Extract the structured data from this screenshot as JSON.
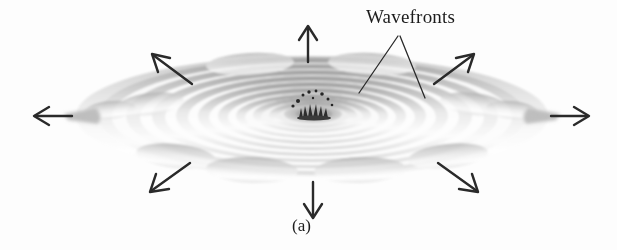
{
  "figure": {
    "panel_label": "(a)",
    "annotation_label": "Wavefronts",
    "background_color": "#fdfdfd",
    "ink_color": "#2a2a2a",
    "wave_light": "#ffffff",
    "wave_mid": "#c9c9c9",
    "wave_dark": "#9a9a9a"
  },
  "geometry": {
    "center_x": 312,
    "center_y": 116,
    "ring_count": 11,
    "outer_rx": 236,
    "outer_ry": 62
  },
  "arrows": [
    {
      "name": "arrow-up",
      "direction": "up",
      "angle_deg": 270,
      "tip_x": 308,
      "tip_y": 26
    },
    {
      "name": "arrow-down",
      "direction": "down",
      "angle_deg": 90,
      "tip_x": 313,
      "tip_y": 218
    },
    {
      "name": "arrow-left",
      "direction": "left",
      "angle_deg": 180,
      "tip_x": 34,
      "tip_y": 116
    },
    {
      "name": "arrow-right",
      "direction": "right",
      "angle_deg": 0,
      "tip_x": 588,
      "tip_y": 116
    },
    {
      "name": "arrow-up-left",
      "direction": "up-left",
      "angle_deg": 215,
      "tip_x": 152,
      "tip_y": 54
    },
    {
      "name": "arrow-up-right",
      "direction": "up-right",
      "angle_deg": 325,
      "tip_x": 474,
      "tip_y": 54
    },
    {
      "name": "arrow-down-left",
      "direction": "down-left",
      "angle_deg": 145,
      "tip_x": 150,
      "tip_y": 192
    },
    {
      "name": "arrow-down-right",
      "direction": "down-right",
      "angle_deg": 35,
      "tip_x": 478,
      "tip_y": 192
    }
  ],
  "leader_lines": [
    {
      "name": "leader-left",
      "from_x": 398,
      "from_y": 36,
      "to_x": 359,
      "to_y": 93
    },
    {
      "name": "leader-right",
      "from_x": 400,
      "from_y": 36,
      "to_x": 425,
      "to_y": 98
    }
  ],
  "splash": {
    "name": "central-splash",
    "x": 314,
    "y": 110,
    "droplet_count": 9
  }
}
